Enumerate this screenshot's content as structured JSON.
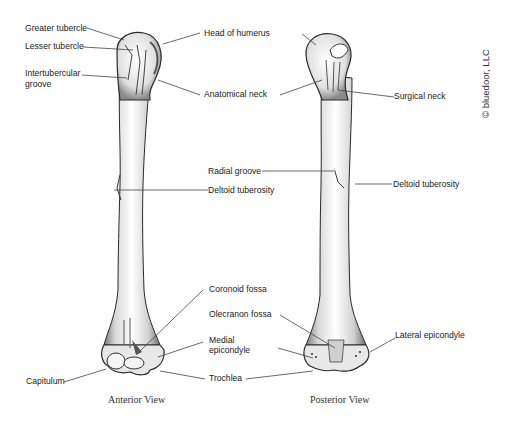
{
  "figure": {
    "subject": "Humerus",
    "copyright": "© bluedoor, LLC"
  },
  "views": [
    {
      "name": "anterior",
      "caption": "Anterior View"
    },
    {
      "name": "posterior",
      "caption": "Posterior View"
    }
  ],
  "labels": {
    "greater_tubercle": "Greater tubercle",
    "lesser_tubercle": "Lesser tubercle",
    "intertubercular_groove_1": "Intertubercular",
    "intertubercular_groove_2": "groove",
    "head_of_humerus": "Head of humerus",
    "anatomical_neck": "Anatomical neck",
    "surgical_neck": "Surgical neck",
    "radial_groove": "Radial groove",
    "deltoid_tuberosity_anterior": "Deltoid tuberosity",
    "deltoid_tuberosity_posterior": "Deltoid tuberosity",
    "coronoid_fossa": "Coronoid fossa",
    "olecranon_fossa": "Olecranon fossa",
    "medial_epicondyle_1": "Medial",
    "medial_epicondyle_2": "epicondyle",
    "lateral_epicondyle": "Lateral epicondyle",
    "capitulum": "Capitulum",
    "trochlea": "Trochlea"
  },
  "colors": {
    "bone_fill": "#f2f2f2",
    "bone_shade": "#9a9a9a",
    "outline": "#2a2a2a",
    "leader_line": "#444444",
    "text": "#222222"
  }
}
